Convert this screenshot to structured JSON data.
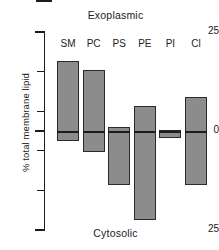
{
  "figure": {
    "top_caption": "Exoplasmic",
    "bottom_caption": "Cytosolic",
    "y_axis_title": "% total membrane lipid"
  },
  "axis": {
    "top_label": "25",
    "bottom_label": "25",
    "zero_label": "0",
    "tick_values": [
      25,
      15,
      5,
      0,
      -5,
      -15,
      -25
    ],
    "labeled_ticks": [
      "25",
      "",
      "",
      "0",
      "",
      "",
      "25"
    ]
  },
  "colors": {
    "bar_fill": "#8c8c8c",
    "bar_stroke": "#2a2a2a",
    "axis": "#1c1c1c",
    "text": "#222222",
    "background": "#ffffff"
  },
  "chart_data": {
    "type": "bar",
    "title": "",
    "subtitle": "",
    "xlabel": "",
    "ylabel": "% total membrane lipid",
    "ylim": [
      -25,
      25
    ],
    "grid": false,
    "legend": "none",
    "orientation": "vertical",
    "annotations": [
      {
        "text": "Exoplasmic",
        "position": "top-center"
      },
      {
        "text": "Cytosolic",
        "position": "bottom-center"
      }
    ],
    "axis_note": "Values above 0 are exoplasmic leaflet; values below 0 are cytosolic leaflet. Lower axis tick labelled 25 denotes -25.",
    "categories": [
      "SM",
      "PC",
      "PS",
      "PE",
      "PI",
      "Cl"
    ],
    "series": [
      {
        "name": "Exoplasmic leaflet",
        "values": [
          17.7,
          15.4,
          1.0,
          6.3,
          0.3,
          8.6
        ]
      },
      {
        "name": "Cytosolic leaflet",
        "values": [
          -2.5,
          -5.3,
          -13.6,
          -22.5,
          -1.8,
          -13.6
        ]
      }
    ],
    "bars": [
      {
        "category": "SM",
        "top": 17.7,
        "bottom": -2.5,
        "total": 20.2
      },
      {
        "category": "PC",
        "top": 15.4,
        "bottom": -5.3,
        "total": 20.7
      },
      {
        "category": "PS",
        "top": 1.0,
        "bottom": -13.6,
        "total": 14.6
      },
      {
        "category": "PE",
        "top": 6.3,
        "bottom": -22.5,
        "total": 28.8
      },
      {
        "category": "PI",
        "top": 0.3,
        "bottom": -1.8,
        "total": 2.1
      },
      {
        "category": "Cl",
        "top": 8.6,
        "bottom": -13.6,
        "total": 22.2
      }
    ]
  }
}
